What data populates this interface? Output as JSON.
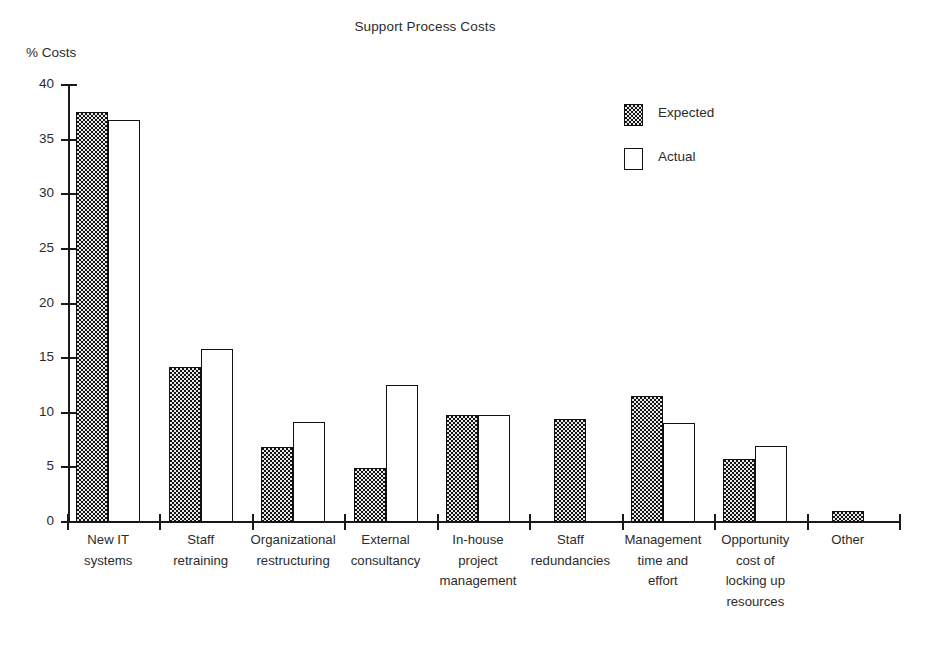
{
  "chart_data": {
    "type": "bar",
    "title": "Support Process Costs",
    "xlabel": "",
    "ylabel": "% Costs",
    "ylim": [
      0,
      40
    ],
    "yticks": [
      0,
      5,
      10,
      15,
      20,
      25,
      30,
      35,
      40
    ],
    "grid": false,
    "legend_position": "upper-right",
    "categories": [
      "New IT systems",
      "Staff retraining",
      "Organizational restructuring",
      "External consultancy",
      "In-house project management",
      "Staff redundancies",
      "Management time and effort",
      "Opportunity cost of locking up resources",
      "Other"
    ],
    "category_lines": [
      [
        "New IT",
        "systems"
      ],
      [
        "Staff",
        "retraining"
      ],
      [
        "Organizational",
        "restructuring"
      ],
      [
        "External",
        "consultancy"
      ],
      [
        "In-house",
        "project",
        "management"
      ],
      [
        "Staff",
        "redundancies"
      ],
      [
        "Management",
        "time and",
        "effort"
      ],
      [
        "Opportunity",
        "cost of",
        "locking up",
        "resources"
      ],
      [
        "Other"
      ]
    ],
    "series": [
      {
        "name": "Expected",
        "fill": "stippled",
        "values": [
          37.5,
          14.2,
          6.9,
          4.9,
          9.8,
          9.4,
          11.5,
          5.8,
          1.0
        ]
      },
      {
        "name": "Actual",
        "fill": "white",
        "values": [
          36.8,
          15.8,
          9.2,
          12.5,
          9.8,
          null,
          9.1,
          7.0,
          null
        ]
      }
    ]
  },
  "legend": {
    "items": [
      {
        "label": "Expected"
      },
      {
        "label": "Actual"
      }
    ]
  },
  "colors": {
    "ink": "#1a1a1a",
    "bar_outline": "#111111",
    "expected_fill": "#e9e9e9",
    "actual_fill": "#ffffff",
    "background": "#ffffff"
  },
  "tick_labels": [
    "40",
    "35",
    "30",
    "25",
    "20",
    "15",
    "10",
    "5",
    "0"
  ]
}
